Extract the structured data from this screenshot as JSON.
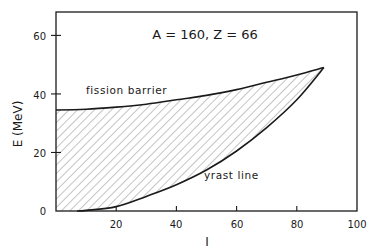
{
  "chart_data": {
    "type": "area",
    "title": "A = 160, Z = 66",
    "xlabel": "I",
    "ylabel": "E (MeV)",
    "xlim": [
      0,
      100
    ],
    "ylim": [
      0,
      68
    ],
    "xticks": [
      20,
      40,
      60,
      80,
      100
    ],
    "xtick_labels": [
      "20",
      "40",
      "60",
      "80",
      "100"
    ],
    "yticks": [
      0,
      20,
      40,
      60
    ],
    "ytick_labels": [
      "0",
      "20",
      "40",
      "60"
    ],
    "grid": false,
    "legend": null,
    "series": [
      {
        "name": "fission barrier",
        "x": [
          0,
          10,
          20,
          30,
          40,
          50,
          60,
          70,
          80,
          89
        ],
        "y": [
          34.5,
          34.8,
          35.5,
          36.5,
          38,
          39.5,
          41.5,
          44,
          46.5,
          49
        ]
      },
      {
        "name": "yrast line",
        "x": [
          7,
          10,
          20,
          30,
          40,
          50,
          60,
          70,
          80,
          89
        ],
        "y": [
          0,
          0.2,
          1.5,
          5,
          9,
          14,
          20.5,
          28.5,
          38,
          49
        ]
      }
    ],
    "shaded_region": "hatched area between yrast line and fission barrier",
    "annotations": [
      {
        "text": "fission barrier",
        "x": 10,
        "y": 40
      },
      {
        "text": "yrast line",
        "x": 50,
        "y": 10
      },
      {
        "text": "A = 160, Z = 66",
        "x": 55,
        "y": 59
      }
    ]
  },
  "labels": {
    "title": "A = 160, Z = 66",
    "xlabel": "I",
    "ylabel": "E (MeV)",
    "fission": "fission barrier",
    "yrast": "yrast line",
    "x20": "20",
    "x40": "40",
    "x60": "60",
    "x80": "80",
    "x100": "100",
    "y0": "0",
    "y20": "20",
    "y40": "40",
    "y60": "60"
  },
  "colors": {
    "line": "#1a1a1a",
    "hatch": "#8a8a8a",
    "background": "#ffffff"
  }
}
